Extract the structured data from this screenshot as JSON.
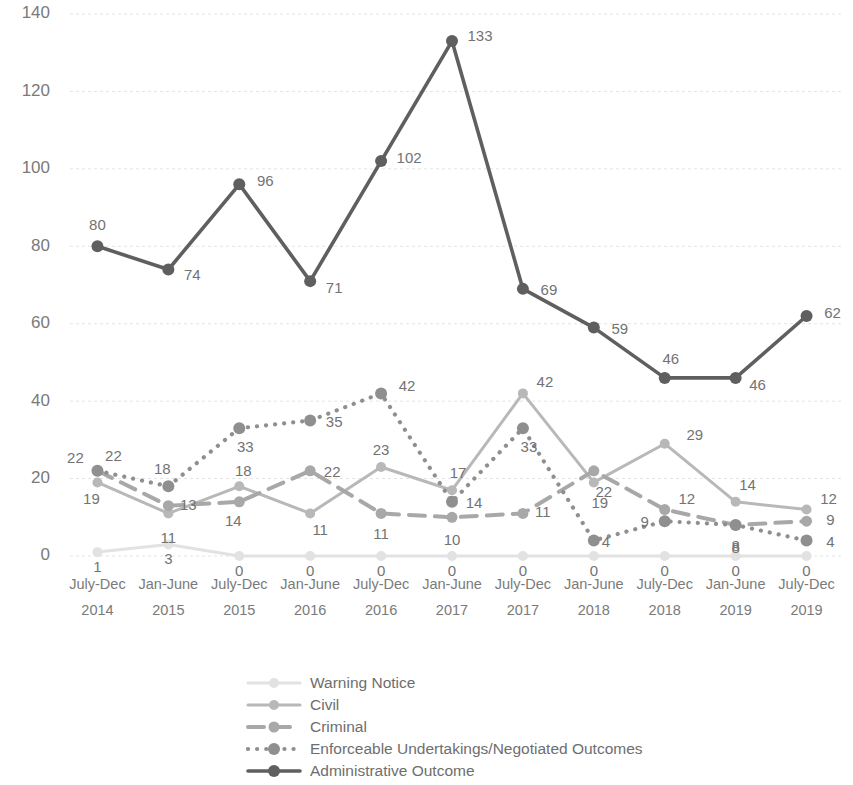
{
  "chart_data": {
    "type": "line",
    "title": "",
    "subtitle": "",
    "xlabel": "",
    "ylabel": "",
    "ylim": [
      0,
      140
    ],
    "yticks": [
      0,
      20,
      40,
      60,
      80,
      100,
      120,
      140
    ],
    "grid": true,
    "legend_position": "bottom",
    "categories": [
      "July-Dec 2014",
      "Jan-June 2015",
      "July-Dec 2015",
      "Jan-June 2016",
      "July-Dec 2016",
      "Jan-June 2017",
      "July-Dec 2017",
      "Jan-June 2018",
      "July-Dec 2018",
      "Jan-June 2019",
      "July-Dec 2019"
    ],
    "category_lines": [
      [
        "July-Dec",
        "2014"
      ],
      [
        "Jan-June",
        "2015"
      ],
      [
        "July-Dec",
        "2015"
      ],
      [
        "Jan-June",
        "2016"
      ],
      [
        "July-Dec",
        "2016"
      ],
      [
        "Jan-June",
        "2017"
      ],
      [
        "July-Dec",
        "2017"
      ],
      [
        "Jan-June",
        "2018"
      ],
      [
        "July-Dec",
        "2018"
      ],
      [
        "Jan-June",
        "2019"
      ],
      [
        "July-Dec",
        "2019"
      ]
    ],
    "series": [
      {
        "name": "Warning Notice",
        "color": "#e2e2e2",
        "style": "solid",
        "values": [
          1,
          3,
          0,
          0,
          0,
          0,
          0,
          0,
          0,
          0,
          0
        ],
        "label_offsets": [
          {
            "dx": 0,
            "dy": 20
          },
          {
            "dx": 0,
            "dy": 20
          },
          {
            "dx": 0,
            "dy": 20
          },
          {
            "dx": 0,
            "dy": 20
          },
          {
            "dx": 0,
            "dy": 20
          },
          {
            "dx": 0,
            "dy": 20
          },
          {
            "dx": 0,
            "dy": 20
          },
          {
            "dx": 0,
            "dy": 20
          },
          {
            "dx": 0,
            "dy": 20
          },
          {
            "dx": 0,
            "dy": 20
          },
          {
            "dx": 0,
            "dy": 20
          }
        ]
      },
      {
        "name": "Civil",
        "color": "#b8b8b8",
        "style": "solid",
        "values": [
          19,
          11,
          18,
          11,
          23,
          17,
          42,
          19,
          29,
          14,
          12
        ],
        "label_offsets": [
          {
            "dx": -6,
            "dy": 22
          },
          {
            "dx": 0,
            "dy": 30
          },
          {
            "dx": 4,
            "dy": -10
          },
          {
            "dx": 10,
            "dy": 22
          },
          {
            "dx": 0,
            "dy": -12
          },
          {
            "dx": 6,
            "dy": -12
          },
          {
            "dx": 22,
            "dy": -6
          },
          {
            "dx": 6,
            "dy": 26
          },
          {
            "dx": 30,
            "dy": -4
          },
          {
            "dx": 12,
            "dy": -12
          },
          {
            "dx": 22,
            "dy": -6
          }
        ]
      },
      {
        "name": "Criminal",
        "color": "#a8a8a8",
        "style": "dashed",
        "values": [
          22,
          13,
          14,
          22,
          11,
          10,
          11,
          22,
          12,
          8,
          9
        ],
        "label_offsets": [
          {
            "dx": -22,
            "dy": -8
          },
          {
            "dx": 20,
            "dy": 4
          },
          {
            "dx": -6,
            "dy": 24
          },
          {
            "dx": 22,
            "dy": 6
          },
          {
            "dx": 0,
            "dy": 26
          },
          {
            "dx": 0,
            "dy": 28
          },
          {
            "dx": 20,
            "dy": 4
          },
          {
            "dx": 10,
            "dy": 26
          },
          {
            "dx": 22,
            "dy": -6
          },
          {
            "dx": 0,
            "dy": 28
          },
          {
            "dx": 24,
            "dy": 4
          }
        ]
      },
      {
        "name": "Enforceable Undertakings/Negotiated Outcomes",
        "color": "#8f8f8f",
        "style": "dotted",
        "values": [
          22,
          18,
          33,
          35,
          42,
          14,
          33,
          4,
          9,
          8,
          4
        ],
        "label_offsets": [
          {
            "dx": 16,
            "dy": -10
          },
          {
            "dx": -6,
            "dy": -12
          },
          {
            "dx": 6,
            "dy": 24
          },
          {
            "dx": 24,
            "dy": 6
          },
          {
            "dx": 26,
            "dy": -2
          },
          {
            "dx": 22,
            "dy": 6
          },
          {
            "dx": 6,
            "dy": 24
          },
          {
            "dx": 12,
            "dy": 6
          },
          {
            "dx": -20,
            "dy": 6
          },
          {
            "dx": 0,
            "dy": 26
          },
          {
            "dx": 24,
            "dy": 6
          }
        ]
      },
      {
        "name": "Administrative Outcome",
        "color": "#5f5f5f",
        "style": "solid-thick",
        "values": [
          80,
          74,
          96,
          71,
          102,
          133,
          69,
          59,
          46,
          46,
          62
        ],
        "label_offsets": [
          {
            "dx": 0,
            "dy": -16
          },
          {
            "dx": 24,
            "dy": 10
          },
          {
            "dx": 26,
            "dy": 2
          },
          {
            "dx": 24,
            "dy": 12
          },
          {
            "dx": 28,
            "dy": 2
          },
          {
            "dx": 28,
            "dy": 0
          },
          {
            "dx": 26,
            "dy": 6
          },
          {
            "dx": 26,
            "dy": 6
          },
          {
            "dx": 6,
            "dy": -14
          },
          {
            "dx": 22,
            "dy": 12
          },
          {
            "dx": 26,
            "dy": 2
          }
        ]
      }
    ]
  },
  "legend": {
    "items": [
      {
        "label": "Warning Notice"
      },
      {
        "label": "Civil"
      },
      {
        "label": "Criminal"
      },
      {
        "label": "Enforceable Undertakings/Negotiated Outcomes"
      },
      {
        "label": "Administrative Outcome"
      }
    ]
  }
}
